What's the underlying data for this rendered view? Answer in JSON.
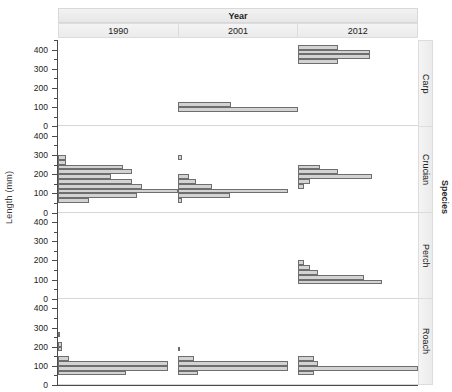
{
  "axes": {
    "ylabel": "Length (mm)",
    "xlabel": "",
    "ytick_labels": [
      "0",
      "100",
      "200",
      "300",
      "400"
    ],
    "ytick_values": [
      0,
      100,
      200,
      300,
      400
    ],
    "ylim": [
      0,
      450
    ]
  },
  "strips": {
    "top_outer_label": "Year",
    "right_outer_label": "Species",
    "columns": [
      {
        "label": "1990"
      },
      {
        "label": "2001"
      },
      {
        "label": "2012"
      }
    ],
    "rows": [
      {
        "label": "Carp"
      },
      {
        "label": "Crucian"
      },
      {
        "label": "Perch"
      },
      {
        "label": "Roach"
      }
    ]
  },
  "style": {
    "bar_fill": "#d3d3d3",
    "bar_stroke": "#6e6e6e",
    "strip_bg": "#efefef",
    "axis_color": "#4a4a4a",
    "grid_color": "#d7d7d7"
  },
  "chart_data": {
    "type": "bar",
    "orientation": "horizontal",
    "title": "",
    "subtitle": "",
    "xlabel": "Count",
    "ylabel": "Length (mm)",
    "ylim": [
      0,
      450
    ],
    "xlim": [
      0,
      100
    ],
    "grid": false,
    "legend": "none",
    "facet_rows": [
      "Carp",
      "Crucian",
      "Perch",
      "Roach"
    ],
    "facet_cols": [
      "1990",
      "2001",
      "2012"
    ],
    "bin_width": 25,
    "note": "Faceted horizontal histograms of fish length by species (rows) and survey year (columns). Each bar spans one 25 mm length bin; bar length encodes count (relative units, 0-100).",
    "panels": [
      {
        "species": "Carp",
        "year": "1990",
        "bins": []
      },
      {
        "species": "Carp",
        "year": "2001",
        "bins": [
          {
            "y0": 100,
            "y1": 125,
            "count": 44
          },
          {
            "y0": 75,
            "y1": 100,
            "count": 100
          }
        ]
      },
      {
        "species": "Carp",
        "year": "2012",
        "bins": [
          {
            "y0": 400,
            "y1": 425,
            "count": 33
          },
          {
            "y0": 375,
            "y1": 400,
            "count": 60
          },
          {
            "y0": 350,
            "y1": 375,
            "count": 60
          },
          {
            "y0": 325,
            "y1": 350,
            "count": 33
          }
        ]
      },
      {
        "species": "Crucian",
        "year": "1990",
        "bins": [
          {
            "y0": 275,
            "y1": 300,
            "count": 7
          },
          {
            "y0": 250,
            "y1": 275,
            "count": 7
          },
          {
            "y0": 225,
            "y1": 250,
            "count": 54
          },
          {
            "y0": 200,
            "y1": 225,
            "count": 62
          },
          {
            "y0": 175,
            "y1": 200,
            "count": 44
          },
          {
            "y0": 150,
            "y1": 175,
            "count": 62
          },
          {
            "y0": 125,
            "y1": 150,
            "count": 70
          },
          {
            "y0": 100,
            "y1": 125,
            "count": 100
          },
          {
            "y0": 75,
            "y1": 100,
            "count": 66
          },
          {
            "y0": 50,
            "y1": 75,
            "count": 26
          }
        ]
      },
      {
        "species": "Crucian",
        "year": "2001",
        "bins": [
          {
            "y0": 275,
            "y1": 300,
            "count": 3
          },
          {
            "y0": 175,
            "y1": 200,
            "count": 9
          },
          {
            "y0": 150,
            "y1": 175,
            "count": 15
          },
          {
            "y0": 125,
            "y1": 150,
            "count": 28
          },
          {
            "y0": 100,
            "y1": 125,
            "count": 92
          },
          {
            "y0": 75,
            "y1": 100,
            "count": 43
          },
          {
            "y0": 50,
            "y1": 75,
            "count": 3
          }
        ]
      },
      {
        "species": "Crucian",
        "year": "2012",
        "bins": [
          {
            "y0": 225,
            "y1": 250,
            "count": 18
          },
          {
            "y0": 200,
            "y1": 225,
            "count": 33
          },
          {
            "y0": 175,
            "y1": 200,
            "count": 62
          },
          {
            "y0": 150,
            "y1": 175,
            "count": 10
          },
          {
            "y0": 125,
            "y1": 150,
            "count": 5
          }
        ]
      },
      {
        "species": "Perch",
        "year": "1990",
        "bins": []
      },
      {
        "species": "Perch",
        "year": "2001",
        "bins": []
      },
      {
        "species": "Perch",
        "year": "2012",
        "bins": [
          {
            "y0": 175,
            "y1": 200,
            "count": 5
          },
          {
            "y0": 150,
            "y1": 175,
            "count": 10
          },
          {
            "y0": 125,
            "y1": 150,
            "count": 17
          },
          {
            "y0": 100,
            "y1": 125,
            "count": 55
          },
          {
            "y0": 75,
            "y1": 100,
            "count": 70
          }
        ]
      },
      {
        "species": "Roach",
        "year": "1990",
        "bins": [
          {
            "y0": 250,
            "y1": 275,
            "count": 2
          },
          {
            "y0": 200,
            "y1": 225,
            "count": 3
          },
          {
            "y0": 175,
            "y1": 200,
            "count": 3
          },
          {
            "y0": 125,
            "y1": 150,
            "count": 9
          },
          {
            "y0": 100,
            "y1": 125,
            "count": 92
          },
          {
            "y0": 75,
            "y1": 100,
            "count": 92
          },
          {
            "y0": 50,
            "y1": 75,
            "count": 57
          }
        ]
      },
      {
        "species": "Roach",
        "year": "2001",
        "bins": [
          {
            "y0": 175,
            "y1": 200,
            "count": 2
          },
          {
            "y0": 125,
            "y1": 150,
            "count": 13
          },
          {
            "y0": 100,
            "y1": 125,
            "count": 92
          },
          {
            "y0": 75,
            "y1": 100,
            "count": 92
          },
          {
            "y0": 50,
            "y1": 75,
            "count": 17
          }
        ]
      },
      {
        "species": "Roach",
        "year": "2012",
        "bins": [
          {
            "y0": 125,
            "y1": 150,
            "count": 13
          },
          {
            "y0": 100,
            "y1": 125,
            "count": 17
          },
          {
            "y0": 75,
            "y1": 100,
            "count": 100
          },
          {
            "y0": 50,
            "y1": 75,
            "count": 13
          }
        ]
      }
    ]
  }
}
